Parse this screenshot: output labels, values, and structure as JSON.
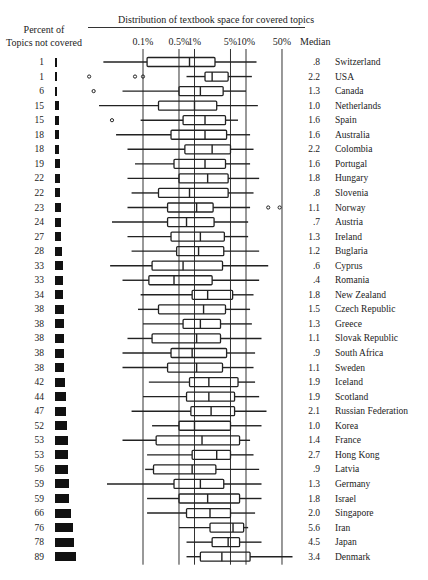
{
  "chart_data": {
    "type": "boxplot",
    "title": "Distribution of textbook space for covered topics",
    "left_column_label": "Percent of Topics not covered",
    "right_column_label": "Median",
    "x_scale": "log",
    "x_ticks": [
      "0.1%",
      "0.5%",
      "1%",
      "5%",
      "10%",
      "50%"
    ],
    "x_tick_values": [
      0.1,
      0.5,
      1,
      5,
      10,
      50
    ],
    "rows": [
      {
        "country": "Switzerland",
        "pct_not_covered": 1,
        "median": ".8",
        "wlo": 0.017,
        "q1": 0.12,
        "med": 0.8,
        "q3": 2.5,
        "whi": 16,
        "outliers": []
      },
      {
        "country": "USA",
        "pct_not_covered": 1,
        "median": "2.2",
        "wlo": 0.7,
        "q1": 1.6,
        "med": 2.2,
        "q3": 4.5,
        "whi": 13,
        "outliers": [
          0.009,
          0.07,
          0.1
        ]
      },
      {
        "country": "Canada",
        "pct_not_covered": 6,
        "median": "1.3",
        "wlo": 0.04,
        "q1": 0.5,
        "med": 1.3,
        "q3": 3.6,
        "whi": 10,
        "outliers": [
          0.011
        ]
      },
      {
        "country": "Netherlands",
        "pct_not_covered": 15,
        "median": "1.0",
        "wlo": 0.014,
        "q1": 0.2,
        "med": 1.0,
        "q3": 2.7,
        "whi": 17,
        "outliers": []
      },
      {
        "country": "Spain",
        "pct_not_covered": 15,
        "median": "1.6",
        "wlo": 0.09,
        "q1": 0.6,
        "med": 1.6,
        "q3": 4.0,
        "whi": 7,
        "outliers": [
          0.025
        ]
      },
      {
        "country": "Australia",
        "pct_not_covered": 18,
        "median": "1.6",
        "wlo": 0.03,
        "q1": 0.35,
        "med": 1.6,
        "q3": 4.2,
        "whi": 12,
        "outliers": []
      },
      {
        "country": "Colombia",
        "pct_not_covered": 18,
        "median": "2.2",
        "wlo": 0.05,
        "q1": 0.65,
        "med": 2.2,
        "q3": 5.0,
        "whi": 14,
        "outliers": []
      },
      {
        "country": "Portugal",
        "pct_not_covered": 19,
        "median": "1.6",
        "wlo": 0.07,
        "q1": 0.4,
        "med": 1.6,
        "q3": 4.0,
        "whi": 12,
        "outliers": []
      },
      {
        "country": "Hungary",
        "pct_not_covered": 22,
        "median": "1.8",
        "wlo": 0.05,
        "q1": 0.5,
        "med": 1.8,
        "q3": 4.5,
        "whi": 18,
        "outliers": []
      },
      {
        "country": "Slovenia",
        "pct_not_covered": 22,
        "median": ".8",
        "wlo": 0.06,
        "q1": 0.2,
        "med": 0.8,
        "q3": 4.5,
        "whi": 14,
        "outliers": []
      },
      {
        "country": "Norway",
        "pct_not_covered": 23,
        "median": "1.1",
        "wlo": 0.05,
        "q1": 0.3,
        "med": 1.1,
        "q3": 2.3,
        "whi": 12,
        "outliers": [
          27,
          45
        ]
      },
      {
        "country": "Austria",
        "pct_not_covered": 24,
        "median": ".7",
        "wlo": 0.025,
        "q1": 0.3,
        "med": 0.7,
        "q3": 2.4,
        "whi": 11,
        "outliers": []
      },
      {
        "country": "Ireland",
        "pct_not_covered": 27,
        "median": "1.3",
        "wlo": 0.05,
        "q1": 0.35,
        "med": 1.3,
        "q3": 3.8,
        "whi": 11,
        "outliers": []
      },
      {
        "country": "Buglaria",
        "pct_not_covered": 28,
        "median": "1.2",
        "wlo": 0.06,
        "q1": 0.45,
        "med": 1.2,
        "q3": 3.7,
        "whi": 18,
        "outliers": []
      },
      {
        "country": "Cyprus",
        "pct_not_covered": 33,
        "median": ".6",
        "wlo": 0.023,
        "q1": 0.15,
        "med": 0.6,
        "q3": 3.5,
        "whi": 27,
        "outliers": []
      },
      {
        "country": "Romania",
        "pct_not_covered": 33,
        "median": ".4",
        "wlo": 0.04,
        "q1": 0.13,
        "med": 0.4,
        "q3": 2.2,
        "whi": 18,
        "outliers": []
      },
      {
        "country": "New Zealand",
        "pct_not_covered": 34,
        "median": "1.8",
        "wlo": 0.09,
        "q1": 0.9,
        "med": 1.8,
        "q3": 5.5,
        "whi": 14,
        "outliers": []
      },
      {
        "country": "Czech Republic",
        "pct_not_covered": 38,
        "median": "1.5",
        "wlo": 0.08,
        "q1": 0.2,
        "med": 1.5,
        "q3": 4.0,
        "whi": 12,
        "outliers": []
      },
      {
        "country": "Greece",
        "pct_not_covered": 38,
        "median": "1.3",
        "wlo": 0.1,
        "q1": 0.6,
        "med": 1.3,
        "q3": 3.2,
        "whi": 13,
        "outliers": []
      },
      {
        "country": "Slovak Republic",
        "pct_not_covered": 38,
        "median": "1.1",
        "wlo": 0.05,
        "q1": 0.15,
        "med": 1.1,
        "q3": 3.2,
        "whi": 20,
        "outliers": []
      },
      {
        "country": "South Africa",
        "pct_not_covered": 38,
        "median": ".9",
        "wlo": 0.04,
        "q1": 0.35,
        "med": 0.9,
        "q3": 4.2,
        "whi": 15,
        "outliers": []
      },
      {
        "country": "Sweden",
        "pct_not_covered": 38,
        "median": "1.1",
        "wlo": 0.04,
        "q1": 0.3,
        "med": 1.1,
        "q3": 3.5,
        "whi": 14,
        "outliers": []
      },
      {
        "country": "Iceland",
        "pct_not_covered": 42,
        "median": "1.9",
        "wlo": 0.13,
        "q1": 0.8,
        "med": 1.9,
        "q3": 7.0,
        "whi": 15,
        "outliers": []
      },
      {
        "country": "Scotland",
        "pct_not_covered": 44,
        "median": "1.9",
        "wlo": 0.1,
        "q1": 0.7,
        "med": 1.9,
        "q3": 6.0,
        "whi": 18,
        "outliers": []
      },
      {
        "country": "Russian Federation",
        "pct_not_covered": 47,
        "median": "2.1",
        "wlo": 0.06,
        "q1": 0.85,
        "med": 2.1,
        "q3": 6.0,
        "whi": 25,
        "outliers": []
      },
      {
        "country": "Korea",
        "pct_not_covered": 52,
        "median": "1.0",
        "wlo": 0.15,
        "q1": 0.5,
        "med": 1.0,
        "q3": 5.0,
        "whi": 20,
        "outliers": []
      },
      {
        "country": "France",
        "pct_not_covered": 53,
        "median": "1.4",
        "wlo": 0.04,
        "q1": 0.18,
        "med": 1.4,
        "q3": 7.5,
        "whi": 12,
        "outliers": []
      },
      {
        "country": "Hong Kong",
        "pct_not_covered": 53,
        "median": "2.7",
        "wlo": 0.12,
        "q1": 0.9,
        "med": 2.7,
        "q3": 5.0,
        "whi": 14,
        "outliers": []
      },
      {
        "country": "Latvia",
        "pct_not_covered": 56,
        "median": ".9",
        "wlo": 0.11,
        "q1": 0.16,
        "med": 0.9,
        "q3": 2.6,
        "whi": 18,
        "outliers": []
      },
      {
        "country": "Germany",
        "pct_not_covered": 59,
        "median": "1.3",
        "wlo": 0.02,
        "q1": 0.4,
        "med": 1.3,
        "q3": 3.7,
        "whi": 20,
        "outliers": []
      },
      {
        "country": "Israel",
        "pct_not_covered": 59,
        "median": "1.8",
        "wlo": 0.12,
        "q1": 0.5,
        "med": 1.8,
        "q3": 7.5,
        "whi": 20,
        "outliers": []
      },
      {
        "country": "Singapore",
        "pct_not_covered": 66,
        "median": "2.0",
        "wlo": 0.12,
        "q1": 0.7,
        "med": 2.0,
        "q3": 5.0,
        "whi": 15,
        "outliers": []
      },
      {
        "country": "Iran",
        "pct_not_covered": 76,
        "median": "5.6",
        "wlo": 0.5,
        "q1": 2.0,
        "med": 5.6,
        "q3": 9.0,
        "whi": 11,
        "outliers": []
      },
      {
        "country": "Japan",
        "pct_not_covered": 78,
        "median": "4.5",
        "wlo": 0.7,
        "q1": 2.2,
        "med": 4.5,
        "q3": 7.5,
        "whi": 20,
        "outliers": []
      },
      {
        "country": "Denmark",
        "pct_not_covered": 89,
        "median": "3.4",
        "wlo": 0.7,
        "q1": 1.3,
        "med": 3.4,
        "q3": 12,
        "whi": 80,
        "outliers": []
      }
    ]
  },
  "header": {
    "title": "Distribution of textbook space for covered topics",
    "left_label_line1": "Percent of",
    "left_label_line2": "Topics not covered",
    "median_label": "Median"
  },
  "colors": {
    "ink": "#222222",
    "bar": "#111111",
    "background": "#ffffff"
  }
}
